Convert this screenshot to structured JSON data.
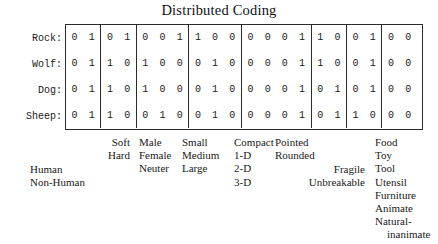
{
  "title": "Distributed Coding",
  "matrix": {
    "row_labels": [
      "Rock:",
      "Wolf:",
      "Dog:",
      "Sheep:"
    ],
    "group_sizes": [
      2,
      2,
      3,
      3,
      4,
      2,
      2,
      7
    ],
    "rows": [
      {
        "label": "Rock:",
        "groups": [
          [
            "0",
            "1"
          ],
          [
            "0",
            "1"
          ],
          [
            "0",
            "0",
            "1"
          ],
          [
            "1",
            "0",
            "0"
          ],
          [
            "0",
            "0",
            "0",
            "1"
          ],
          [
            "1",
            "0"
          ],
          [
            "0",
            "1"
          ],
          [
            "0",
            "0",
            "0",
            "0",
            "0",
            "0",
            "1"
          ]
        ]
      },
      {
        "label": "Wolf:",
        "groups": [
          [
            "0",
            "1"
          ],
          [
            "1",
            "0"
          ],
          [
            "1",
            "0",
            "0"
          ],
          [
            "0",
            "1",
            "0"
          ],
          [
            "0",
            "0",
            "0",
            "1"
          ],
          [
            "1",
            "0"
          ],
          [
            "0",
            "1"
          ],
          [
            "0",
            "0",
            "0",
            "0",
            "0",
            "1",
            "0"
          ]
        ]
      },
      {
        "label": "Dog:",
        "groups": [
          [
            "0",
            "1"
          ],
          [
            "1",
            "0"
          ],
          [
            "1",
            "0",
            "0"
          ],
          [
            "0",
            "1",
            "0"
          ],
          [
            "0",
            "0",
            "0",
            "1"
          ],
          [
            "0",
            "1"
          ],
          [
            "0",
            "1"
          ],
          [
            "0",
            "0",
            "0",
            "0",
            "0",
            "1",
            "0"
          ]
        ]
      },
      {
        "label": "Sheep:",
        "groups": [
          [
            "0",
            "1"
          ],
          [
            "1",
            "0"
          ],
          [
            "0",
            "1",
            "0"
          ],
          [
            "0",
            "1",
            "0"
          ],
          [
            "0",
            "0",
            "0",
            "1"
          ],
          [
            "0",
            "1"
          ],
          [
            "1",
            "0"
          ],
          [
            "0",
            "0",
            "0",
            "0",
            "0",
            "1",
            "0"
          ]
        ]
      }
    ]
  },
  "legend": {
    "human": [
      "Human",
      "Non-Human"
    ],
    "texture": [
      "Soft",
      "Hard"
    ],
    "gender": [
      "Male",
      "Female",
      "Neuter"
    ],
    "size": [
      "Small",
      "Medium",
      "Large"
    ],
    "shape": [
      "Compact",
      "1-D",
      "2-D",
      "3-D"
    ],
    "point": [
      "Pointed",
      "Rounded"
    ],
    "fragile": [
      "Fragile",
      "Unbreakable"
    ],
    "function": [
      "Food",
      "Toy",
      "Tool",
      "Utensil",
      "Furniture",
      "Animate",
      "Natural-",
      "inanimate"
    ]
  }
}
